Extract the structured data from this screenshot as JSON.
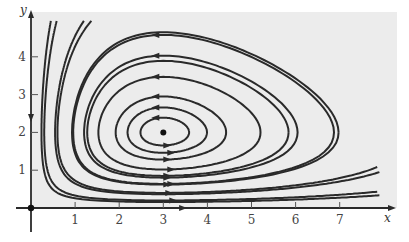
{
  "figure": {
    "background_color": "#ececec",
    "curve_color": "#2a2a2a"
  },
  "chart_data": {
    "type": "line",
    "title": "",
    "xlabel": "x",
    "ylabel": "y",
    "xlim": [
      0,
      8
    ],
    "ylim": [
      0,
      5
    ],
    "x_ticks": [
      "1",
      "2",
      "3",
      "4",
      "5",
      "6",
      "7"
    ],
    "y_ticks": [
      "1",
      "2",
      "3",
      "4"
    ],
    "equilibria": [
      {
        "x": 3,
        "y": 2,
        "label": "center"
      },
      {
        "x": 0,
        "y": 0,
        "label": "saddle"
      }
    ],
    "conserved_quantity": "H(x,y) = x - 3 ln x + 1.5 (y - 2 ln y)",
    "closed_orbits_top_at_x3": [
      2.39,
      2.66,
      2.95,
      3.47,
      4.03,
      4.58
    ],
    "open_trajectories": [
      {
        "name": "left-steep-1",
        "x_at_top": 0.45
      },
      {
        "name": "left-steep-2",
        "x_at_top": 1.2
      },
      {
        "name": "bottom-open-1",
        "y_at_x3": 0.4
      },
      {
        "name": "bottom-open-2",
        "y_at_x3": 0.2
      }
    ],
    "direction": "counterclockwise around (3,2); arrows point left on top, right on bottom",
    "axis_arrows": {
      "y_axis_direction": "down",
      "x_axis_direction": "right"
    }
  }
}
